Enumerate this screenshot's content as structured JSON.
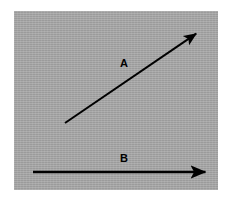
{
  "figure": {
    "background_color": "#ffffff",
    "panel_color": "#a8a8a8",
    "stroke_color": "#000000",
    "width": 234,
    "height": 202
  },
  "panel": {
    "x": 14,
    "y": 11,
    "width": 204,
    "height": 179
  },
  "vectors": [
    {
      "id": "A",
      "label": "A",
      "label_x": 124,
      "label_y": 64,
      "tail_x": 65,
      "tail_y": 123,
      "head_x": 200,
      "head_y": 31,
      "orientation": "diagonal-up-right",
      "stroke_width": 2,
      "color": "#000000"
    },
    {
      "id": "B",
      "label": "B",
      "label_x": 124,
      "label_y": 159,
      "tail_x": 33,
      "tail_y": 172,
      "head_x": 210,
      "head_y": 172,
      "orientation": "horizontal-right",
      "stroke_width": 2,
      "color": "#000000"
    }
  ]
}
